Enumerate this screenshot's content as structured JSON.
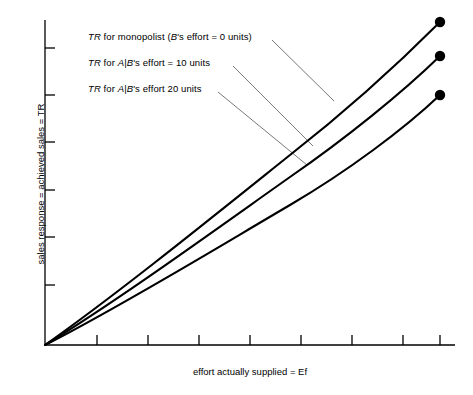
{
  "chart_data": {
    "type": "line",
    "title": "",
    "xlabel": "effort actually supplied = Ef",
    "ylabel": "sales response = achieved sales = TR",
    "xlim": [
      0,
      100
    ],
    "ylim": [
      0,
      100
    ],
    "grid": false,
    "legend_position": "inline-annotations",
    "x_ticks_count": 8,
    "y_ticks_count": 6,
    "x_tick_labels": [],
    "y_tick_labels": [],
    "annotations": [
      {
        "id": "monopolist",
        "text": "TR for monopolist (B's effort = 0 units)",
        "parts": [
          {
            "t": "TR",
            "italic": true
          },
          {
            "t": " for monopolist (",
            "italic": false
          },
          {
            "t": "B",
            "italic": true
          },
          {
            "t": "'s effort = 0 units)",
            "italic": false
          }
        ],
        "target_series": "TR for monopolist (B's effort = 0 units)"
      },
      {
        "id": "effort10",
        "text": "TR for A|B's effort = 10 units",
        "parts": [
          {
            "t": "TR",
            "italic": true
          },
          {
            "t": " for ",
            "italic": false
          },
          {
            "t": "A",
            "italic": true
          },
          {
            "t": "|",
            "italic": false
          },
          {
            "t": "B",
            "italic": true
          },
          {
            "t": "'s effort = 10 units",
            "italic": false
          }
        ],
        "target_series": "TR for A|B's effort = 10 units"
      },
      {
        "id": "effort20",
        "text": "TR for A|B's effort 20 units",
        "parts": [
          {
            "t": "TR",
            "italic": true
          },
          {
            "t": " for ",
            "italic": false
          },
          {
            "t": "A",
            "italic": true
          },
          {
            "t": "|",
            "italic": false
          },
          {
            "t": "B",
            "italic": true
          },
          {
            "t": "'s effort 20 units",
            "italic": false
          }
        ],
        "target_series": "TR for A|B's effort 20 units"
      }
    ],
    "series": [
      {
        "name": "TR for monopolist (B's effort = 0 units)",
        "color": "#000000",
        "endpoint_marker": "filled-circle",
        "x": [
          0,
          10,
          20,
          30,
          40,
          50,
          60,
          70,
          80,
          90,
          100
        ],
        "y": [
          0,
          12.4,
          24.3,
          35.6,
          46.2,
          56.2,
          65.5,
          74.1,
          82.0,
          89.3,
          99.4
        ]
      },
      {
        "name": "TR for A|B's effort = 10 units",
        "color": "#000000",
        "endpoint_marker": "filled-circle",
        "x": [
          0,
          10,
          20,
          30,
          40,
          50,
          60,
          70,
          80,
          90,
          100
        ],
        "y": [
          0,
          11.2,
          21.9,
          32.0,
          41.5,
          50.5,
          58.8,
          66.5,
          73.5,
          80.0,
          89.0
        ]
      },
      {
        "name": "TR for A|B's effort 20 units",
        "color": "#000000",
        "endpoint_marker": "filled-circle",
        "x": [
          0,
          10,
          20,
          30,
          40,
          50,
          60,
          70,
          80,
          90,
          100
        ],
        "y": [
          0,
          9.6,
          18.7,
          27.2,
          35.2,
          42.7,
          49.6,
          56.0,
          61.8,
          67.2,
          76.9
        ]
      }
    ],
    "colors": {
      "axis": "#000000",
      "curve": "#000000",
      "leader_line": "#555555",
      "marker": "#000000",
      "background": "#ffffff"
    }
  }
}
